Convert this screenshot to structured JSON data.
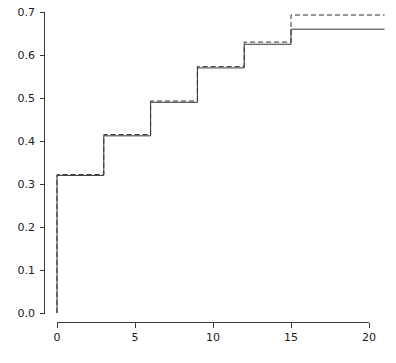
{
  "chart_data": {
    "type": "line",
    "title": "",
    "subtitle": "",
    "xlabel": "",
    "ylabel": "",
    "xlim": [
      -1.2,
      21.5
    ],
    "ylim": [
      0.0,
      0.7
    ],
    "grid": false,
    "legend": null,
    "step_shape": "hv",
    "x_ticks": [
      0,
      5,
      10,
      15,
      20
    ],
    "x_tick_labels": [
      "0",
      "5",
      "10",
      "15",
      "20"
    ],
    "y_ticks": [
      0.0,
      0.1,
      0.2,
      0.3,
      0.4,
      0.5,
      0.6,
      0.7
    ],
    "y_tick_labels": [
      "0.0",
      "0.1",
      "0.2",
      "0.3",
      "0.4",
      "0.5",
      "0.6",
      "0.7"
    ],
    "series": [
      {
        "name": "solid-step-curve",
        "style": "solid",
        "color": "#333333",
        "x": [
          0,
          0,
          3,
          6,
          9,
          12,
          15,
          21
        ],
        "values": [
          0.0,
          0.32,
          0.412,
          0.49,
          0.57,
          0.625,
          0.66,
          0.66
        ]
      },
      {
        "name": "dashed-step-curve",
        "style": "dashed",
        "color": "#333333",
        "x": [
          0,
          0,
          3,
          6,
          9,
          12,
          15,
          21
        ],
        "values": [
          0.0,
          0.322,
          0.415,
          0.493,
          0.573,
          0.63,
          0.693,
          0.693
        ]
      }
    ],
    "jump_points": [
      0,
      3,
      6,
      9,
      12,
      15
    ],
    "annotations": []
  },
  "axes": {
    "y_axis_name": "y-axis",
    "x_axis_name": "x-axis"
  }
}
